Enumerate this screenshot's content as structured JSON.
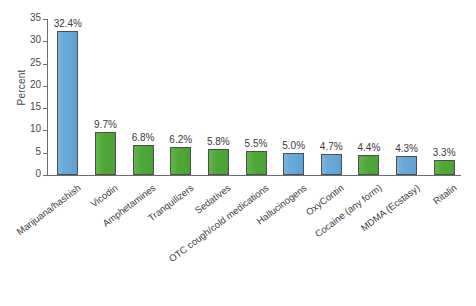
{
  "chart_data": {
    "type": "bar",
    "title": "",
    "subtitle": "",
    "xlabel": "",
    "ylabel": "Percent",
    "ylim": [
      0,
      35
    ],
    "ytick_values": [
      0,
      5,
      10,
      15,
      20,
      25,
      30,
      35
    ],
    "ytick_labels": [
      "0",
      "5",
      "10",
      "15",
      "20",
      "25",
      "30",
      "35"
    ],
    "grid": false,
    "legend": null,
    "categories": [
      "Marijuana/hashish",
      "Vicodin",
      "Amphetamines",
      "Tranquilizers",
      "Sedatives",
      "OTC cough/cold medications",
      "Hallucinogens",
      "OxyContin",
      "Cocaine (any form)",
      "MDMA (Ecstasy)",
      "Ritalin"
    ],
    "values": [
      32.4,
      9.7,
      6.8,
      6.2,
      5.8,
      5.5,
      5.0,
      4.7,
      4.4,
      4.3,
      3.3
    ],
    "value_labels": [
      "32.4%",
      "9.7%",
      "6.8%",
      "6.2%",
      "5.8%",
      "5.5%",
      "5.0%",
      "4.7%",
      "4.4%",
      "4.3%",
      "3.3%"
    ],
    "bar_colors": [
      "blue",
      "green",
      "green",
      "green",
      "green",
      "green",
      "blue",
      "blue",
      "green",
      "blue",
      "green"
    ],
    "colors": {
      "blue": "#69a9d8",
      "green": "#4ea838",
      "bar_outline": "#4d4d4d",
      "axis": "#6d6d6d",
      "text": "#3a3a3a",
      "background": "#ffffff"
    }
  }
}
